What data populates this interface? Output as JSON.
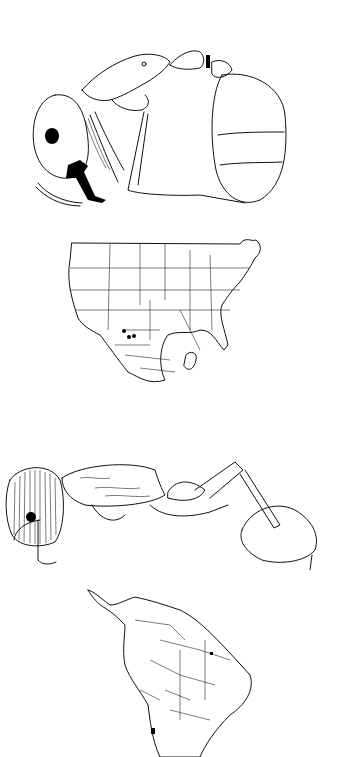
{
  "figure": {
    "panels": [
      {
        "id": "a",
        "type": "illustration",
        "subject": "ant-lateral-view-compact",
        "icon": "ant-drawing-icon"
      },
      {
        "id": "b",
        "type": "map",
        "region": "North America (USA and Mexico)",
        "icon": "map-icon",
        "points": [
          {
            "x": 125,
            "y": 331
          },
          {
            "x": 129,
            "y": 336
          },
          {
            "x": 134,
            "y": 335
          }
        ]
      },
      {
        "id": "c",
        "type": "illustration",
        "subject": "ant-lateral-view-elongate",
        "icon": "ant-drawing-icon"
      },
      {
        "id": "d",
        "type": "map",
        "region": "South America",
        "icon": "map-icon",
        "points": [
          {
            "x": 155,
            "y": 730
          }
        ]
      }
    ],
    "colors": {
      "background": "#ffffff",
      "line": "#111111",
      "marker": "#000000"
    }
  }
}
